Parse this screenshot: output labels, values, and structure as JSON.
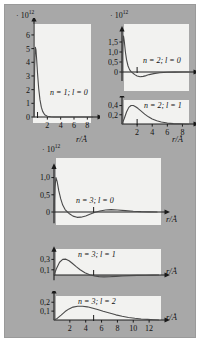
{
  "figure": {
    "background_color": "#a8a8a8",
    "panel_color": "#f2f2f0",
    "curve_color": "#4a4a4a",
    "axis_color": "#1a1a1a",
    "scale_label": "· 10",
    "scale_exponent": "12",
    "x_axis_title": "r/Å"
  },
  "chart_data": {
    "type": "line",
    "xlabel": "r/Å",
    "ylabel": "· 10^12",
    "grid": false,
    "legend": "none",
    "panels": [
      {
        "id": "n1-l0",
        "label": "n = 1; l = 0",
        "n": 1,
        "l": 0,
        "xlim": [
          0,
          9
        ],
        "ylim": [
          0,
          6.8
        ],
        "xticks": [
          2,
          4,
          6,
          8
        ],
        "xtick_labels": [
          "2",
          "4",
          "6",
          "8"
        ],
        "yticks": [
          0,
          1,
          2,
          3,
          4,
          5,
          6
        ],
        "ytick_labels": [
          "0",
          "1",
          "2",
          "3",
          "4",
          "5",
          "6"
        ],
        "marker_r": 0.53,
        "x": [
          0.0,
          0.1,
          0.2,
          0.3,
          0.4,
          0.53,
          0.7,
          0.9,
          1.1,
          1.3,
          1.6,
          2.0,
          2.5,
          3.0,
          3.5,
          4.0,
          5.0,
          6.0,
          7.0,
          8.0,
          8.8
        ],
        "y": [
          0.0,
          3.6,
          5.1,
          4.9,
          4.2,
          3.2,
          2.1,
          1.25,
          0.72,
          0.41,
          0.17,
          0.055,
          0.015,
          0.004,
          0.001,
          0.0,
          0.0,
          0.0,
          0.0,
          0.0,
          0.0
        ]
      },
      {
        "id": "n2-l0",
        "label": "n = 2; l = 0",
        "n": 2,
        "l": 0,
        "xlim": [
          0,
          9
        ],
        "ylim": [
          -0.45,
          1.9
        ],
        "xticks": [],
        "xtick_labels": [],
        "yticks": [
          0,
          0.5,
          1.0,
          1.5
        ],
        "ytick_labels": [
          "0",
          "0,5",
          "1,0",
          "1,5"
        ],
        "marker_r": 2.0,
        "x": [
          0.0,
          0.1,
          0.2,
          0.3,
          0.45,
          0.6,
          0.8,
          1.0,
          1.2,
          1.45,
          1.7,
          2.0,
          2.4,
          2.8,
          3.2,
          3.6,
          4.2,
          5.0,
          6.0,
          7.0,
          8.0,
          8.8
        ],
        "y": [
          0.0,
          1.35,
          1.8,
          1.55,
          1.0,
          0.62,
          0.3,
          0.12,
          0.02,
          -0.06,
          -0.13,
          -0.2,
          -0.24,
          -0.22,
          -0.18,
          -0.13,
          -0.08,
          -0.035,
          -0.012,
          -0.004,
          0.0,
          0.0
        ]
      },
      {
        "id": "n2-l1",
        "label": "n = 2; l = 1",
        "n": 2,
        "l": 1,
        "xlim": [
          0,
          9
        ],
        "ylim": [
          0,
          0.52
        ],
        "xticks": [
          2,
          4,
          6,
          8
        ],
        "xtick_labels": [
          "2",
          "4",
          "6",
          "8"
        ],
        "yticks": [
          0.2,
          0.4
        ],
        "ytick_labels": [
          "0,2",
          "0,4"
        ],
        "marker_r": 2.0,
        "x": [
          0.0,
          0.3,
          0.6,
          0.9,
          1.2,
          1.5,
          1.8,
          2.1,
          2.5,
          3.0,
          3.5,
          4.0,
          4.6,
          5.2,
          6.0,
          6.8,
          7.6,
          8.4,
          8.8
        ],
        "y": [
          0.0,
          0.12,
          0.26,
          0.36,
          0.4,
          0.4,
          0.375,
          0.34,
          0.285,
          0.215,
          0.155,
          0.11,
          0.07,
          0.042,
          0.02,
          0.009,
          0.004,
          0.001,
          0.0
        ]
      },
      {
        "id": "n3-l0",
        "label": "n = 3; l = 0",
        "n": 3,
        "l": 0,
        "xlim": [
          0,
          13.5
        ],
        "ylim": [
          -0.33,
          1.18
        ],
        "xticks": [],
        "xtick_labels": [],
        "yticks": [
          0,
          0.5,
          1.0
        ],
        "ytick_labels": [
          "0",
          "0,5",
          "1,0"
        ],
        "marker_r": 5.0,
        "x": [
          0.0,
          0.12,
          0.25,
          0.4,
          0.6,
          0.85,
          1.1,
          1.4,
          1.7,
          2.0,
          2.4,
          2.9,
          3.4,
          4.0,
          4.6,
          5.2,
          5.8,
          6.5,
          7.2,
          8.0,
          9.0,
          10.0,
          11.0,
          12.0,
          13.0
        ],
        "y": [
          0.0,
          0.72,
          1.0,
          0.88,
          0.62,
          0.38,
          0.2,
          0.07,
          0.0,
          -0.06,
          -0.12,
          -0.155,
          -0.15,
          -0.115,
          -0.06,
          -0.01,
          0.03,
          0.06,
          0.068,
          0.06,
          0.04,
          0.022,
          0.01,
          0.004,
          0.001
        ]
      },
      {
        "id": "n3-l1",
        "label": "n = 3; l = 1",
        "n": 3,
        "l": 1,
        "xlim": [
          0,
          13.5
        ],
        "ylim": [
          -0.1,
          0.4
        ],
        "xticks": [],
        "xtick_labels": [],
        "yticks": [
          0.1,
          0.3
        ],
        "ytick_labels": [
          "0,1",
          "0,3"
        ],
        "marker_r": 5.0,
        "x": [
          0.0,
          0.3,
          0.7,
          1.1,
          1.5,
          1.9,
          2.3,
          2.8,
          3.3,
          3.9,
          4.5,
          5.1,
          5.7,
          6.3,
          7.0,
          7.8,
          8.6,
          9.5,
          10.5,
          11.5,
          12.5,
          13.2
        ],
        "y": [
          0.0,
          0.12,
          0.245,
          0.3,
          0.305,
          0.275,
          0.225,
          0.16,
          0.1,
          0.045,
          0.005,
          -0.02,
          -0.032,
          -0.036,
          -0.033,
          -0.026,
          -0.019,
          -0.012,
          -0.007,
          -0.004,
          -0.002,
          0.0
        ]
      },
      {
        "id": "n3-l2",
        "label": "n = 3; l = 2",
        "n": 3,
        "l": 2,
        "xlim": [
          0,
          13.5
        ],
        "ylim": [
          0,
          0.27
        ],
        "xticks": [
          2,
          4,
          6,
          8,
          10,
          12
        ],
        "xtick_labels": [
          "2",
          "4",
          "6",
          "8",
          "10",
          "12"
        ],
        "yticks": [
          0.1,
          0.2
        ],
        "ytick_labels": [
          "0,1",
          "0,2"
        ],
        "marker_r": 5.0,
        "x": [
          0.0,
          0.4,
          0.9,
          1.4,
          1.9,
          2.4,
          3.0,
          3.6,
          4.2,
          4.8,
          5.5,
          6.2,
          7.0,
          7.8,
          8.6,
          9.4,
          10.2,
          11.0,
          11.8,
          12.6,
          13.2
        ],
        "y": [
          0.0,
          0.018,
          0.055,
          0.095,
          0.125,
          0.145,
          0.155,
          0.155,
          0.148,
          0.135,
          0.118,
          0.098,
          0.078,
          0.058,
          0.042,
          0.029,
          0.019,
          0.012,
          0.007,
          0.003,
          0.0
        ]
      }
    ]
  }
}
